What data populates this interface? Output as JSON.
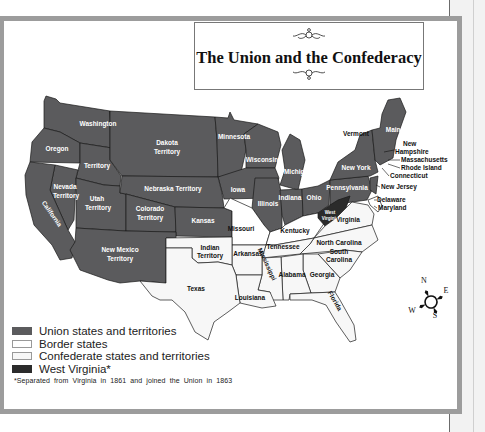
{
  "map": {
    "title": "The Union and the Confederacy",
    "colors": {
      "union": "#5b5b5d",
      "border": "#ffffff",
      "confederate": "#f7f7f7",
      "west_virginia": "#2b2b2b",
      "frame": "#9c9c9c",
      "outline": "#1a1a1a"
    },
    "labels": {
      "washington": "Washington",
      "oregon": "Oregon",
      "territory": "Territory",
      "dakota_1": "Dakota",
      "dakota_2": "Territory",
      "minnesota": "Minnesota",
      "wisconsin": "Wisconsin",
      "michigan": "Michigan",
      "new_york": "New York",
      "vermont": "Vermont",
      "maine": "Maine",
      "new_hampshire_1": "New",
      "new_hampshire_2": "Hampshire",
      "massachusetts": "Massachusetts",
      "rhode_island": "Rhode Island",
      "connecticut": "Connecticut",
      "new_jersey": "New Jersey",
      "delaware": "Delaware",
      "maryland": "Maryland",
      "pennsylvania": "Pennsylvania",
      "ohio": "Ohio",
      "indiana": "Indiana",
      "illinois": "Illinois",
      "iowa": "Iowa",
      "nevada_1": "Nevada",
      "nevada_2": "Territory",
      "utah_1": "Utah",
      "utah_2": "Territory",
      "nebraska": "Nebraska Territory",
      "colorado_1": "Colorado",
      "colorado_2": "Territory",
      "kansas": "Kansas",
      "california": "California",
      "new_mexico_1": "New Mexico",
      "new_mexico_2": "Territory",
      "missouri": "Missouri",
      "kentucky": "Kentucky",
      "west_virginia_1": "West",
      "west_virginia_2": "Virginia",
      "virginia": "Virginia",
      "north_carolina": "North Carolina",
      "south_carolina_1": "South",
      "south_carolina_2": "Carolina",
      "tennessee": "Tennessee",
      "indian_territory_1": "Indian",
      "indian_territory_2": "Territory",
      "arkansas": "Arkansas",
      "mississippi": "Mississippi",
      "alabama": "Alabama",
      "georgia": "Georgia",
      "louisiana": "Louisiana",
      "texas": "Texas",
      "florida": "Florida"
    },
    "compass": {
      "n": "N",
      "e": "E",
      "s": "S",
      "w": "W"
    },
    "legend": [
      {
        "label": "Union states and territories",
        "color": "#5b5b5d"
      },
      {
        "label": "Border states",
        "color": "#ffffff"
      },
      {
        "label": "Confederate states and territories",
        "color": "#f7f7f7"
      },
      {
        "label": "West Virginia*",
        "color": "#2b2b2b"
      }
    ],
    "footnote": "*Separated from Virginia in 1861 and joined the Union in 1863"
  }
}
